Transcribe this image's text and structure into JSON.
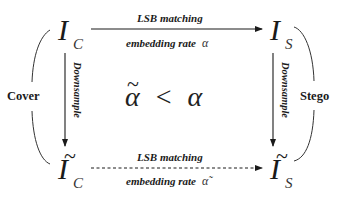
{
  "diagram": {
    "nodes": {
      "cover_image": {
        "base": "I",
        "subscript": "C",
        "tilde": false
      },
      "stego_image": {
        "base": "I",
        "subscript": "S",
        "tilde": false
      },
      "downsampled_cover": {
        "base": "I",
        "subscript": "C",
        "tilde": true,
        "tilde_glyph": "~"
      },
      "downsampled_stego": {
        "base": "I",
        "subscript": "S",
        "tilde": true,
        "tilde_glyph": "~"
      }
    },
    "edges": {
      "top": {
        "label_above": "LSB matching",
        "label_below": "embedding rate",
        "rate_symbol": "α",
        "style": "solid"
      },
      "bottom": {
        "label_above": "LSB matching",
        "label_below": "embedding rate",
        "rate_symbol": "α̃",
        "style": "dashed"
      },
      "left": {
        "label": "Downsample",
        "style": "solid"
      },
      "right": {
        "label": "Downsample",
        "style": "solid"
      }
    },
    "groups": {
      "left": "Cover",
      "right": "Stego"
    },
    "relation": {
      "lhs": "α",
      "lhs_tilde": "~",
      "operator": "<",
      "rhs": "α"
    },
    "colors": {
      "ink": "#1a1a1a",
      "background": "#ffffff"
    }
  }
}
